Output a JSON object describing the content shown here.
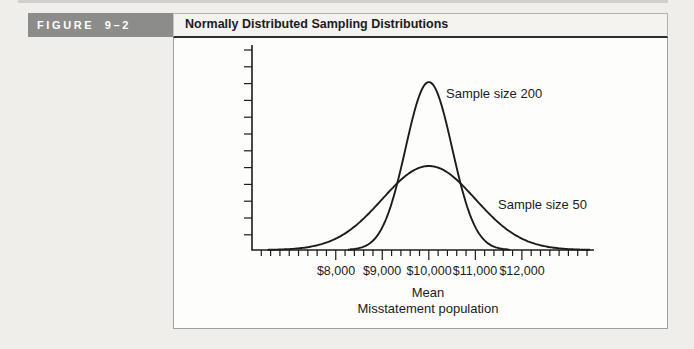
{
  "figure": {
    "label": "FIGURE 9–2"
  },
  "header": {
    "title": "Normally Distributed Sampling Distributions"
  },
  "chart_data": {
    "type": "line",
    "subtype": "normal-distribution-curves",
    "title": "Normally Distributed Sampling Distributions",
    "xlabel": "Mean",
    "xlabel_secondary": "Misstatement population",
    "ylabel": "",
    "xlim": [
      6200,
      13550
    ],
    "x_major_ticks": [
      8000,
      9000,
      10000,
      11000,
      12000
    ],
    "x_tick_labels": [
      "$8,000",
      "$9,000",
      "$10,000",
      "$11,000",
      "$12,000"
    ],
    "x_minor_tick_step": 200,
    "x_minor_tick_range": [
      6400,
      13400
    ],
    "y_axis": {
      "tick_count": 12,
      "tick_labels": "none"
    },
    "grid": false,
    "legend": "inline-annotations",
    "series": [
      {
        "name": "Sample size 200",
        "distribution": "normal",
        "mean": 10000,
        "sd": 500,
        "peak_rel": 1.0
      },
      {
        "name": "Sample size 50",
        "distribution": "normal",
        "mean": 10000,
        "sd": 1000,
        "peak_rel": 0.5
      }
    ],
    "annotations": [
      {
        "text": "Sample size 200",
        "target": "tall narrow curve"
      },
      {
        "text": "Sample size 50",
        "target": "short wide curve"
      }
    ]
  },
  "colors": {
    "page_bg": "#f0eeea",
    "box_bg": "#fdfdfb",
    "header_bg": "#f4f3ef",
    "border": "#a0a0a0",
    "ink": "#1c1c1c",
    "figure_label_bg": "#8c8c8a",
    "figure_label_text": "#ffffff"
  }
}
